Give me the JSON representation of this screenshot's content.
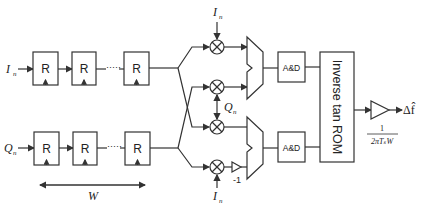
{
  "diagram": {
    "inputs": {
      "i": "I",
      "i_sub": "n",
      "q": "Q",
      "q_sub": "n"
    },
    "register_label": "R",
    "dots": "·····",
    "window_label": "W",
    "multiplier_inputs": [
      {
        "label": "I",
        "sub": "n"
      },
      {
        "label": "Q",
        "sub": "n"
      },
      {
        "label": "I",
        "sub": "n"
      }
    ],
    "negate_gain": "-1",
    "accum_dump_label": "A&D",
    "rom_label": "Inverse tan ROM",
    "gain_numerator": "1",
    "gain_denominator": "2πTₛW",
    "output_label": "Δf̂"
  }
}
